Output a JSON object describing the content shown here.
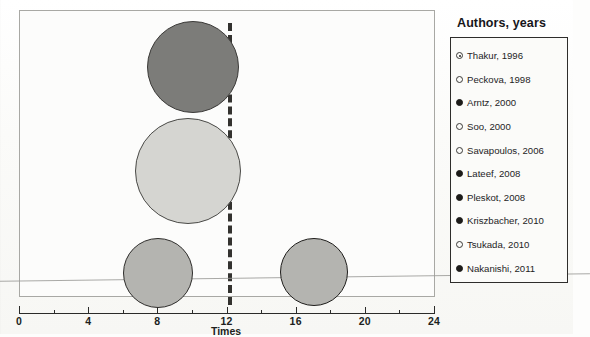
{
  "chart_data": {
    "type": "scatter",
    "title": "",
    "xlabel": "Times",
    "ylabel": "",
    "xlim": [
      0,
      24
    ],
    "grid": false,
    "legend_position": "right",
    "xticks": [
      {
        "value": 0,
        "label": "0"
      },
      {
        "value": 4,
        "label": "4"
      },
      {
        "value": 8,
        "label": "8"
      },
      {
        "value": 12,
        "label": "12"
      },
      {
        "value": 16,
        "label": "16"
      },
      {
        "value": 20,
        "label": "20"
      },
      {
        "value": 24,
        "label": "24"
      }
    ],
    "xminorticks": [
      2,
      6,
      10,
      14,
      18,
      22
    ],
    "reference_line": {
      "orientation": "vertical",
      "value": 12,
      "style": "dashed",
      "color": "#33322f"
    },
    "bubbles": [
      {
        "name": "bubble-dark-large",
        "x": 10.0,
        "radius_px": 46,
        "fill": "#7c7c79",
        "stroke": "#3c3b39"
      },
      {
        "name": "bubble-light-largest",
        "x": 9.7,
        "radius_px": 53,
        "fill": "#d5d5d1",
        "stroke": "#4a4a47"
      },
      {
        "name": "bubble-mid-left",
        "x": 8.0,
        "radius_px": 35,
        "fill": "#b4b4b0",
        "stroke": "#2e2d2b"
      },
      {
        "name": "bubble-mid-right",
        "x": 17.0,
        "radius_px": 34,
        "fill": "#b4b4b0",
        "stroke": "#1f1e1c"
      }
    ]
  },
  "legend": {
    "title": "Authors, years",
    "items": [
      {
        "label": "Thakur, 1996",
        "marker": "target"
      },
      {
        "label": "Peckova, 1998",
        "marker": "hollow"
      },
      {
        "label": "Arntz, 2000",
        "marker": "filled"
      },
      {
        "label": "Soo, 2000",
        "marker": "hollow"
      },
      {
        "label": "Savapoulos, 2006",
        "marker": "hollow"
      },
      {
        "label": "Lateef, 2008",
        "marker": "filled"
      },
      {
        "label": "Pleskot, 2008",
        "marker": "filled"
      },
      {
        "label": "Kriszbacher, 2010",
        "marker": "filled"
      },
      {
        "label": "Tsukada, 2010",
        "marker": "hollow"
      },
      {
        "label": "Nakanishi, 2011",
        "marker": "filled"
      }
    ]
  }
}
